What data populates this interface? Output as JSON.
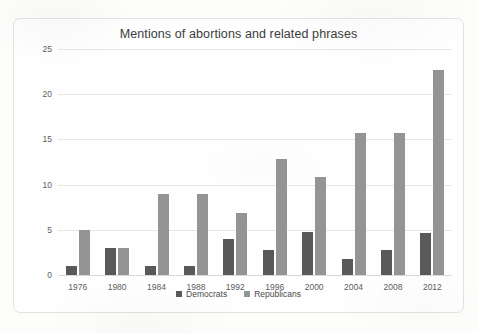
{
  "chart_data": {
    "type": "bar",
    "title": "Mentions of abortions and related phrases",
    "xlabel": "",
    "ylabel": "",
    "ylim": [
      0,
      25
    ],
    "yticks": [
      0,
      5,
      10,
      15,
      20,
      25
    ],
    "grid": true,
    "legend_position": "bottom",
    "categories": [
      "1976",
      "1980",
      "1984",
      "1988",
      "1992",
      "1996",
      "2000",
      "2004",
      "2008",
      "2012"
    ],
    "series": [
      {
        "name": "Democrats",
        "color": "#595959",
        "values": [
          1,
          3,
          1,
          1,
          4,
          2.8,
          4.8,
          1.8,
          2.8,
          4.7
        ]
      },
      {
        "name": "Republicans",
        "color": "#949494",
        "values": [
          5,
          3,
          9,
          9,
          6.9,
          12.8,
          10.8,
          15.7,
          15.7,
          22.7
        ]
      }
    ]
  }
}
